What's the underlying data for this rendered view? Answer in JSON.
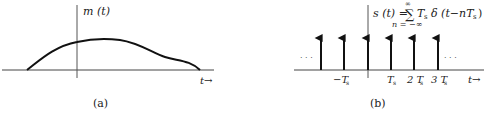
{
  "panel_a": {
    "function_label": "m (t)",
    "t_axis_label": "t→",
    "caption": "(a)",
    "curve": "smooth message signal m(t) rising from zero left of origin, peaking just right of origin, with a shoulder before returning to zero"
  },
  "panel_b": {
    "formula_main": "s (t) = ∑ Tₛ δ (t − nTₛ)",
    "formula_lhs": "s (t) =",
    "formula_sum": "∑",
    "formula_sum_upper": "∞",
    "formula_sum_lower": "n = −∞",
    "formula_term": "T",
    "formula_term_sub": "s",
    "formula_delta": "δ (t−nT",
    "formula_delta_sub": "s",
    "formula_close": ")",
    "ellipsis_left": "· · ·",
    "ellipsis_right": "· · ·",
    "ticks": [
      {
        "label": "−T",
        "sub": "s"
      },
      {
        "label": "T",
        "sub": "s"
      },
      {
        "label": "2 T",
        "sub": "s"
      },
      {
        "label": "3 T",
        "sub": "s"
      }
    ],
    "t_axis_label": "t→",
    "caption": "(b)",
    "impulse_count": 6
  },
  "colors": {
    "stroke": "#111111",
    "axis": "#555555",
    "text": "#222222"
  }
}
